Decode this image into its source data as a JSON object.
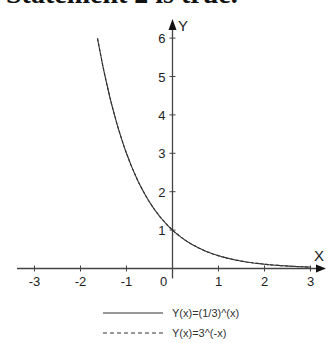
{
  "heading": "Statement 2 is true.",
  "chart_data": {
    "type": "line",
    "title": "",
    "xlabel": "X",
    "ylabel": "Y",
    "xlim": [
      -3.3,
      3.3
    ],
    "ylim": [
      0,
      6.2
    ],
    "x_ticks": [
      -3,
      -2,
      -1,
      0,
      1,
      2,
      3
    ],
    "x_tick_labels": [
      "-3",
      "-2",
      "-1",
      "0",
      "1",
      "2",
      "3"
    ],
    "y_ticks": [
      1,
      2,
      3,
      4,
      5,
      6
    ],
    "y_tick_labels": [
      "1",
      "2",
      "3",
      "4",
      "5",
      "6"
    ],
    "grid": false,
    "legend_position": "bottom",
    "series": [
      {
        "name": "Y(x)=(1/3)^(x)",
        "style": "solid",
        "x": [
          -1.63,
          -1.5,
          -1,
          -0.5,
          0,
          0.5,
          1,
          1.5,
          2,
          2.5,
          3
        ],
        "y": [
          6.0,
          5.2,
          3.0,
          1.73,
          1.0,
          0.58,
          0.33,
          0.19,
          0.11,
          0.06,
          0.04
        ]
      },
      {
        "name": "Y(x)=3^(-x)",
        "style": "dashed",
        "x": [
          -1.63,
          -1.5,
          -1,
          -0.5,
          0,
          0.5,
          1,
          1.5,
          2,
          2.5,
          3
        ],
        "y": [
          6.0,
          5.2,
          3.0,
          1.73,
          1.0,
          0.58,
          0.33,
          0.19,
          0.11,
          0.06,
          0.04
        ]
      }
    ],
    "annotations": "Both curves coincide"
  },
  "legend": {
    "items": [
      {
        "label": "Y(x)=(1/3)^(x)",
        "style": "solid"
      },
      {
        "label": "Y(x)=3^(-x)",
        "style": "dashed"
      }
    ]
  },
  "colors": {
    "axis": "#444444",
    "curve": "#333333"
  }
}
